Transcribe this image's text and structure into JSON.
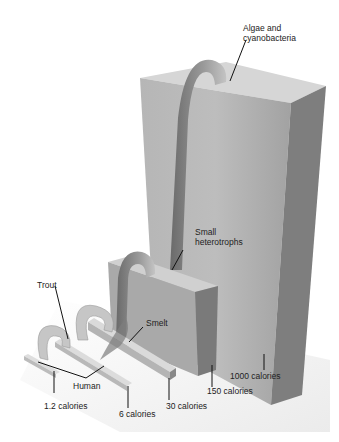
{
  "diagram": {
    "levels": [
      {
        "name": "Algae and cyanobacteria",
        "label_line1": "Algae and",
        "label_line2": "cyanobacteria",
        "calories": "1000 calories"
      },
      {
        "name": "Small heterotrophs",
        "label_line1": "Small",
        "label_line2": "heterotrophs",
        "calories": "150 calories"
      },
      {
        "name": "Smelt",
        "label": "Smelt",
        "calories": "30 calories"
      },
      {
        "name": "Trout",
        "label": "Trout",
        "calories": "6 calories"
      },
      {
        "name": "Human",
        "label": "Human",
        "calories": "1.2 calories"
      }
    ],
    "colors": {
      "block_front": "#a8a8a8",
      "block_top": "#d4d4d4",
      "block_side": "#7c7c7c",
      "arrow": "#c8c8c8",
      "arrow_dark": "#6e6e6e",
      "floor": "#ececec"
    }
  }
}
